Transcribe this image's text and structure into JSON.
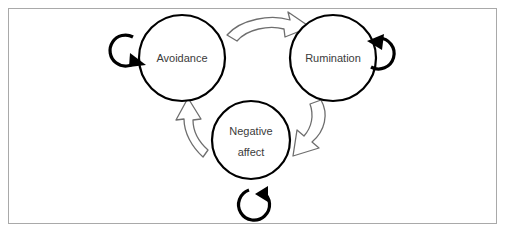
{
  "diagram": {
    "type": "cycle-diagram",
    "title": "",
    "frame": {
      "border_color": "#a9a9a9",
      "background_color": "#ffffff"
    },
    "nodes": [
      {
        "id": "avoidance",
        "label": "Avoidance",
        "label_lines": [
          "Avoidance"
        ],
        "cx": 181,
        "cy": 57,
        "r": 43,
        "stroke_color": "#000000",
        "fill_color": "#ffffff",
        "text_color": "#3b3b3b"
      },
      {
        "id": "rumination",
        "label": "Rumination",
        "label_lines": [
          "Rumination"
        ],
        "cx": 332,
        "cy": 57,
        "r": 43,
        "stroke_color": "#000000",
        "fill_color": "#ffffff",
        "text_color": "#3b3b3b"
      },
      {
        "id": "negative-affect",
        "label": "Negative affect",
        "label_lines": [
          "Negative",
          "affect"
        ],
        "cx": 250,
        "cy": 139,
        "r": 39,
        "stroke_color": "#000000",
        "fill_color": "#ffffff",
        "text_color": "#3b3b3b"
      }
    ],
    "connectors": [
      {
        "id": "avoidance-to-rumination",
        "from": "avoidance",
        "to": "rumination",
        "style": "hollow-block-arrow",
        "direction": "curved-right",
        "position": "top",
        "stroke_color": "#6e6e6e",
        "fill_color": "#ffffff"
      },
      {
        "id": "rumination-to-negative-affect",
        "from": "rumination",
        "to": "negative-affect",
        "style": "hollow-block-arrow",
        "direction": "curved-down-left",
        "position": "right",
        "stroke_color": "#6e6e6e",
        "fill_color": "#ffffff"
      },
      {
        "id": "negative-affect-to-avoidance",
        "from": "negative-affect",
        "to": "avoidance",
        "style": "hollow-block-arrow",
        "direction": "curved-up-left",
        "position": "left",
        "stroke_color": "#6e6e6e",
        "fill_color": "#ffffff"
      }
    ],
    "self_loops": [
      {
        "id": "avoidance-self-loop",
        "node": "avoidance",
        "position": "left",
        "style": "solid-circular-arrow",
        "stroke_color": "#000000"
      },
      {
        "id": "rumination-self-loop",
        "node": "rumination",
        "position": "right",
        "style": "solid-circular-arrow",
        "stroke_color": "#000000"
      },
      {
        "id": "negative-affect-self-loop",
        "node": "negative-affect",
        "position": "bottom",
        "style": "solid-circular-arrow",
        "stroke_color": "#000000"
      }
    ]
  }
}
